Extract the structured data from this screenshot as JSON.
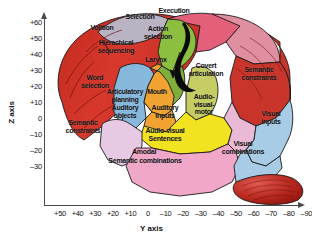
{
  "figure": {
    "kind": "annotated-brain-diagram",
    "background": "#ffffff"
  },
  "axes": {
    "z": {
      "title": "Z axis",
      "ticks": [
        "+60",
        "+50",
        "+40",
        "+30",
        "+20",
        "+10",
        "0",
        "–10",
        "–20",
        "–30"
      ],
      "values": [
        60,
        50,
        40,
        30,
        20,
        10,
        0,
        -10,
        -20,
        -30
      ]
    },
    "y": {
      "title": "Y axis",
      "ticks": [
        "+50",
        "+40",
        "+30",
        "+20",
        "+10",
        "0",
        "–10",
        "–20",
        "–30",
        "–40",
        "–50",
        "–60",
        "–70",
        "–80",
        "–90"
      ],
      "values": [
        50,
        40,
        30,
        20,
        10,
        0,
        -10,
        -20,
        -30,
        -40,
        -50,
        -60,
        -70,
        -80,
        -90
      ]
    }
  },
  "regions": [
    {
      "id": "volition",
      "label": "Volition",
      "color": "#b9b3c4"
    },
    {
      "id": "hierachical-sequencing",
      "label": "Hierachical\nsequencing",
      "color": "#d8382c"
    },
    {
      "id": "selection",
      "label": "Selection",
      "color": "#e4607a"
    },
    {
      "id": "execution",
      "label": "Execution",
      "color": "#e08fa0"
    },
    {
      "id": "action-selection",
      "label": "Action\nselection",
      "color": "#8cbe3f"
    },
    {
      "id": "larynx",
      "label": "Larynx",
      "color": "#7fae3a"
    },
    {
      "id": "mouth",
      "label": "Mouth",
      "color": "#8cbe3f"
    },
    {
      "id": "word-selection",
      "label": "Word\nselection",
      "color": "#86b8dc"
    },
    {
      "id": "articulatory-planning",
      "label": "Articulatory\nplanning",
      "color": "#f0a330"
    },
    {
      "id": "covert-articulation",
      "label": "Covert\narticulation",
      "color": "#c4cc63"
    },
    {
      "id": "auditory-inputs",
      "label": "Auditory\ninputs",
      "color": "#f2e21f"
    },
    {
      "id": "auditory-objects",
      "label": "Auditory\nobjects",
      "color": "#f2e21f"
    },
    {
      "id": "audio-visual-motor",
      "label": "Audio-\nvisual-\nmotor",
      "color": "#f2e21f"
    },
    {
      "id": "semantic-constraints-left",
      "label": "Semantic\nconstraints",
      "color": "#e8c9e4"
    },
    {
      "id": "semantic-constraints-right",
      "label": "Semantic\nconstraints",
      "color": "#e9b9d6"
    },
    {
      "id": "audio-visual-sentences",
      "label": "Audio-visual\nSentences",
      "color": "#f0a7c8"
    },
    {
      "id": "amodal-semantic",
      "label": "Amodal\nSemantic combinations",
      "color": "#f0a7c8"
    },
    {
      "id": "visual-inputs",
      "label": "Visual\ninputs",
      "color": "#a8cbe6"
    },
    {
      "id": "visual-combinations",
      "label": "Visual\ncombinations",
      "color": "#a8cbe6"
    },
    {
      "id": "cerebellum",
      "label": "",
      "color": "#b0231f"
    }
  ],
  "labels": {
    "volition": "Volition",
    "hierachical": "Hierachical",
    "sequencing": "sequencing",
    "selection": "Selection",
    "execution": "Execution",
    "action": "Action",
    "action_selection": "selection",
    "larynx": "Larynx",
    "mouth": "Mouth",
    "word": "Word",
    "word_selection": "selection",
    "articulatory": "Articulatory",
    "planning": "planning",
    "covert": "Covert",
    "articulation": "articulation",
    "auditory_inputs": "Auditory\ninputs",
    "auditory_objects": "Auditory\nobjects",
    "audio_visual_motor": "Audio-\nvisual-\nmotor",
    "semantic_constraints_left": "Semantic\nconstraints",
    "semantic_constraints_right": "Semantic\nconstraints",
    "audio_visual_sentences": "Audio-visual\nSentences",
    "amodal": "Amodal",
    "semantic_combinations": "Semantic combinations",
    "visual_inputs": "Visual\ninputs",
    "visual_combinations": "Visual\ncombinations"
  }
}
